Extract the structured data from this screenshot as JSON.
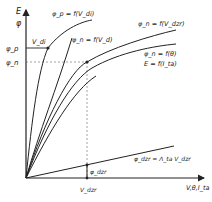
{
  "diagram": {
    "y_axis_labels": [
      "E",
      "φ"
    ],
    "x_axis_label": "V,θ,I_ta",
    "y_ticks": [
      {
        "label": "φ_p",
        "y": 48
      },
      {
        "label": "φ_n",
        "y": 62
      }
    ],
    "x_ticks": [
      {
        "label": "V_dzr",
        "x": 87
      }
    ],
    "marker_labels": {
      "vd": "V_di",
      "phi_dzr": "φ_dzr"
    },
    "curves": [
      {
        "id": "phi_p_vd",
        "label": "φ_p = f(V_di)"
      },
      {
        "id": "phi_n_vd",
        "label": "φ_n = f(V_d)"
      },
      {
        "id": "phi_n_vdzr",
        "label": "φ_n = f(V_dzr)"
      },
      {
        "id": "phi_n_theta",
        "label": "φ_n = f(θ)"
      },
      {
        "id": "e_ita",
        "label": "E = f(I_ta)"
      },
      {
        "id": "phi_dzr_lin",
        "label": "φ_dzr = Λ_ta V_dzr"
      }
    ],
    "colors": {
      "ink": "#222222",
      "background": "#ffffff"
    }
  }
}
